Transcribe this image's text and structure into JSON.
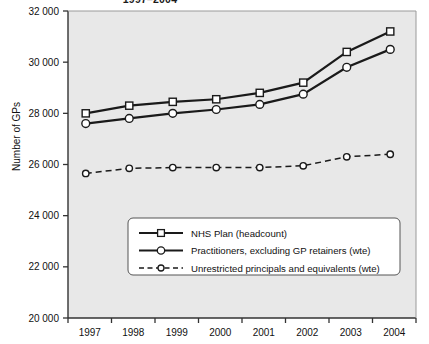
{
  "chart_data": {
    "type": "line",
    "title": "1997–2004",
    "xlabel": "",
    "ylabel": "Number of GPs",
    "x": [
      1997,
      1998,
      1999,
      2000,
      2001,
      2002,
      2003,
      2004
    ],
    "xtick_labels": [
      "1997",
      "1998",
      "1999",
      "2000",
      "2001",
      "2002",
      "2003",
      "2004"
    ],
    "ytick_labels": [
      "20 000",
      "22 000",
      "24 000",
      "26 000",
      "28 000",
      "30 000",
      "32 000"
    ],
    "ytick_values": [
      20000,
      22000,
      24000,
      26000,
      28000,
      30000,
      32000
    ],
    "ylim": [
      20000,
      32000
    ],
    "grid": false,
    "legend_position": "lower-center-inside",
    "series": [
      {
        "name": "NHS Plan (headcount)",
        "marker": "square",
        "line_style": "solid",
        "values": [
          28000,
          28300,
          28450,
          28550,
          28800,
          29200,
          30400,
          31200
        ]
      },
      {
        "name": "Practitioners, excluding GP retainers (wte)",
        "marker": "circle",
        "line_style": "solid",
        "values": [
          27600,
          27800,
          28000,
          28150,
          28350,
          28750,
          29800,
          30500
        ]
      },
      {
        "name": "Unrestricted principals and equivalents (wte)",
        "marker": "circle-small",
        "line_style": "dashed",
        "values": [
          25650,
          25850,
          25880,
          25880,
          25880,
          25950,
          26300,
          26400
        ]
      }
    ]
  },
  "colors": {
    "plot_background": "#e8e8e8",
    "figure_background": "#ffffff",
    "line": "#1a1a1a",
    "marker_fill": "#ffffff",
    "axis": "#333333",
    "legend_background": "#ffffff",
    "legend_border": "#555555",
    "text": "#111111"
  }
}
